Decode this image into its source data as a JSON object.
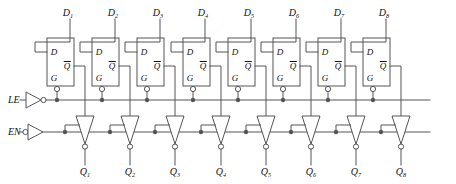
{
  "diagram": {
    "type": "logic-circuit-schematic",
    "width": 456,
    "height": 184,
    "colors": {
      "background": "#ffffff",
      "wire": "#555555",
      "outline": "#555555",
      "text": "#111111",
      "bubble_fill": "#ffffff"
    },
    "line_width": 1,
    "bubble_radius": 2.6,
    "junction_radius": 2.2
  },
  "inputs": {
    "data": [
      {
        "name": "D1",
        "base": "D",
        "sub": "1",
        "x": 68,
        "y": 13
      },
      {
        "name": "D2",
        "base": "D",
        "sub": "2",
        "x": 113,
        "y": 13
      },
      {
        "name": "D3",
        "base": "D",
        "sub": "3",
        "x": 158,
        "y": 13
      },
      {
        "name": "D4",
        "base": "D",
        "sub": "4",
        "x": 203,
        "y": 13
      },
      {
        "name": "D5",
        "base": "D",
        "sub": "5",
        "x": 249,
        "y": 13
      },
      {
        "name": "D6",
        "base": "D",
        "sub": "6",
        "x": 294,
        "y": 13
      },
      {
        "name": "D7",
        "base": "D",
        "sub": "7",
        "x": 339,
        "y": 13
      },
      {
        "name": "D8",
        "base": "D",
        "sub": "8",
        "x": 384,
        "y": 13
      }
    ],
    "control": [
      {
        "name": "LE",
        "label": "LE",
        "x": 8,
        "y": 100,
        "bubble_on_input": false,
        "inverter_output_bubble": true
      },
      {
        "name": "EN",
        "label": "EN",
        "x": 8,
        "y": 132,
        "bubble_on_input": true,
        "inverter_output_bubble": false
      }
    ]
  },
  "outputs": {
    "data": [
      {
        "name": "Q1",
        "base": "Q",
        "sub": "1",
        "x": 85,
        "y": 172
      },
      {
        "name": "Q2",
        "base": "Q",
        "sub": "2",
        "x": 130,
        "y": 172
      },
      {
        "name": "Q3",
        "base": "Q",
        "sub": "3",
        "x": 175,
        "y": 172
      },
      {
        "name": "Q4",
        "base": "Q",
        "sub": "4",
        "x": 221,
        "y": 172
      },
      {
        "name": "Q5",
        "base": "Q",
        "sub": "5",
        "x": 266,
        "y": 172
      },
      {
        "name": "Q6",
        "base": "Q",
        "sub": "6",
        "x": 311,
        "y": 172
      },
      {
        "name": "Q7",
        "base": "Q",
        "sub": "7",
        "x": 356,
        "y": 172
      },
      {
        "name": "Q8",
        "base": "Q",
        "sub": "8",
        "x": 401,
        "y": 172
      }
    ]
  },
  "latches": {
    "count": 8,
    "box": {
      "width": 27,
      "height": 48,
      "top": 38
    },
    "x_positions": [
      47,
      92,
      137,
      183,
      228,
      273,
      318,
      363
    ],
    "port_labels": {
      "d": "D",
      "g": "G",
      "qbar": "Q"
    },
    "qbar_has_overbar": true,
    "g_has_bubble": true,
    "g_bubble_position": "bottom-edge"
  },
  "buffers": {
    "count": 8,
    "type": "tri-state-inverting",
    "orientation": "down",
    "output_bubble": true,
    "apex_y": 144,
    "top_y": 116,
    "half_width": 9,
    "x_positions": [
      85,
      130,
      175,
      221,
      266,
      311,
      356,
      401
    ]
  },
  "buses": {
    "le_bus": {
      "label": "LE bus",
      "y": 100,
      "x_start": 32,
      "x_end": 430
    },
    "en_bus": {
      "label": "EN bus",
      "y": 132,
      "x_start": 32,
      "x_end": 430
    }
  }
}
